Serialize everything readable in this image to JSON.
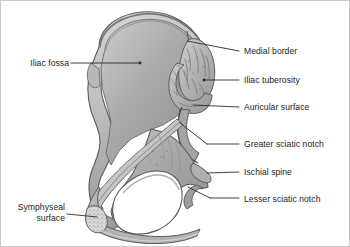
{
  "figure": {
    "background_color": "#ffffff",
    "border_color": "#c9c9c9",
    "bone_fill_color": "#a9a9a9",
    "bone_outline_color": "#4a4a4a",
    "leader_line_color": "#2b2b2b",
    "text_color": "#1c1c1c"
  },
  "labels": [
    {
      "id": "iliac-fossa",
      "text": "Iliac fossa",
      "side": "left",
      "x": 12,
      "y": 57,
      "width": 56
    },
    {
      "id": "symphyseal-surface",
      "text_line1": "Symphyseal",
      "text_line2": "surface",
      "side": "left",
      "x": 4,
      "y": 200,
      "width": 60
    },
    {
      "id": "medial-border",
      "text": "Medial border",
      "side": "right",
      "x": 243,
      "y": 45
    },
    {
      "id": "iliac-tuberosity",
      "text": "Iliac tuberosity",
      "side": "right",
      "x": 243,
      "y": 74
    },
    {
      "id": "auricular-surface",
      "text": "Auricular surface",
      "side": "right",
      "x": 243,
      "y": 101
    },
    {
      "id": "greater-sciatic-notch",
      "text": "Greater sciatic notch",
      "side": "right",
      "x": 243,
      "y": 138
    },
    {
      "id": "ischial-spine",
      "text": "Ischial spine",
      "side": "right",
      "x": 243,
      "y": 166
    },
    {
      "id": "lesser-sciatic-notch",
      "text": "Lesser sciatic notch",
      "side": "right",
      "x": 243,
      "y": 193
    }
  ]
}
